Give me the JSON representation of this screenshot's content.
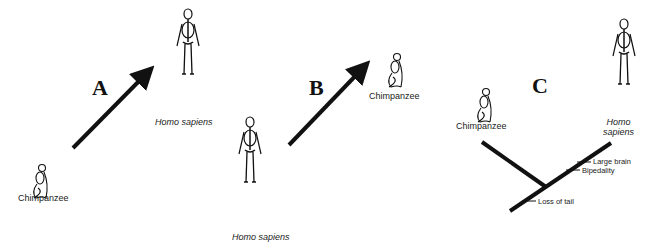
{
  "figure": {
    "panels": [
      {
        "letter": "A",
        "from": {
          "label": "Chimpanzee",
          "italic": false
        },
        "to": {
          "label": "Homo sapiens",
          "italic": true
        },
        "type": "arrow"
      },
      {
        "letter": "B",
        "from": {
          "label": "Homo sapiens",
          "italic": true
        },
        "to": {
          "label": "Chimpanzee",
          "italic": false
        },
        "type": "arrow"
      },
      {
        "letter": "C",
        "type": "cladogram",
        "taxa": [
          {
            "label": "Chimpanzee",
            "italic": false
          },
          {
            "label_line1": "Homo",
            "label_line2": "sapiens",
            "italic": true
          }
        ],
        "traits": [
          {
            "label": "Large brain"
          },
          {
            "label": "Bipedality"
          },
          {
            "label": "Loss of tail"
          }
        ]
      }
    ],
    "caption_visible": "Figure 2.1 (cut off)"
  }
}
